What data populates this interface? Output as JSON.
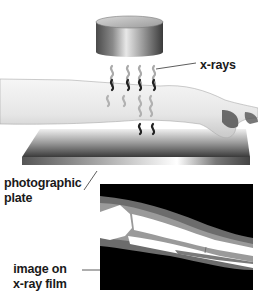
{
  "diagram": {
    "labels": {
      "xrays": "x-rays",
      "plate_line1": "photographic",
      "plate_line2": "plate",
      "film_line1": "image on",
      "film_line2": "x-ray film"
    },
    "components": [
      "x-ray source",
      "x-rays",
      "arm",
      "photographic plate",
      "image on x-ray film"
    ],
    "colors": {
      "background": "#ffffff",
      "text": "#1a1a1a",
      "film_background": "#000000",
      "bone": "#ffffff",
      "soft_tissue": "#8a8a8a"
    }
  }
}
